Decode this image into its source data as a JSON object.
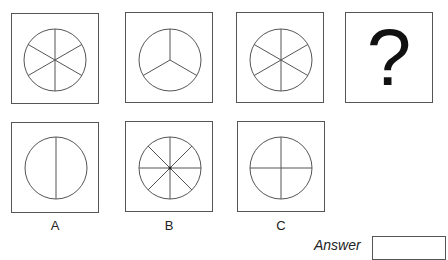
{
  "puzzle": {
    "sequence": [
      {
        "name": "six-segment-circle",
        "spokes": 6
      },
      {
        "name": "three-segment-circle",
        "spokes": 3
      },
      {
        "name": "six-segment-circle",
        "spokes": 6
      },
      {
        "name": "question-mark",
        "text": "?"
      }
    ],
    "options": [
      {
        "label": "A",
        "spokes": 2
      },
      {
        "label": "B",
        "spokes": 8
      },
      {
        "label": "C",
        "spokes": 4
      }
    ],
    "answer_label": "Answer",
    "answer_value": ""
  },
  "colors": {
    "stroke": "#555555",
    "text": "#222222",
    "background": "#ffffff"
  }
}
